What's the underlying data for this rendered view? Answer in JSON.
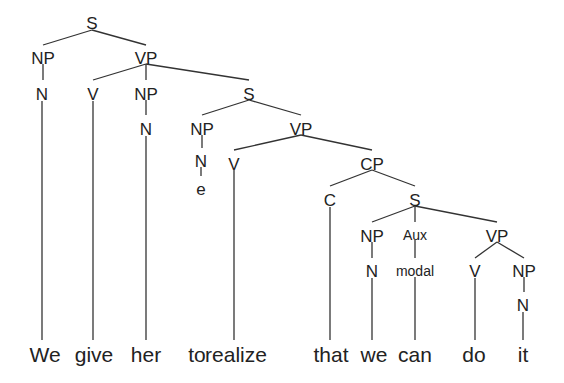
{
  "diagram": {
    "type": "syntax-tree",
    "nodes": [
      {
        "id": "s0",
        "label": "S",
        "x": 92,
        "y": 25,
        "cls": "node"
      },
      {
        "id": "np1",
        "label": "NP",
        "x": 43,
        "y": 60,
        "cls": "node"
      },
      {
        "id": "vp1",
        "label": "VP",
        "x": 146,
        "y": 60,
        "cls": "node"
      },
      {
        "id": "n1",
        "label": "N",
        "x": 42,
        "y": 96,
        "cls": "node"
      },
      {
        "id": "v1",
        "label": "V",
        "x": 93,
        "y": 96,
        "cls": "node"
      },
      {
        "id": "np2",
        "label": "NP",
        "x": 146,
        "y": 96,
        "cls": "node"
      },
      {
        "id": "s1",
        "label": "S",
        "x": 249,
        "y": 96,
        "cls": "node"
      },
      {
        "id": "n2",
        "label": "N",
        "x": 146,
        "y": 131,
        "cls": "node"
      },
      {
        "id": "np3",
        "label": "NP",
        "x": 202,
        "y": 131,
        "cls": "node"
      },
      {
        "id": "vp2",
        "label": "VP",
        "x": 301,
        "y": 131,
        "cls": "node"
      },
      {
        "id": "n3",
        "label": "N",
        "x": 201,
        "y": 163,
        "cls": "node"
      },
      {
        "id": "v2",
        "label": "V",
        "x": 234,
        "y": 166,
        "cls": "node"
      },
      {
        "id": "cp1",
        "label": "CP",
        "x": 372,
        "y": 166,
        "cls": "node"
      },
      {
        "id": "e1",
        "label": "e",
        "x": 201,
        "y": 191,
        "cls": "node"
      },
      {
        "id": "c1",
        "label": "C",
        "x": 330,
        "y": 202,
        "cls": "node"
      },
      {
        "id": "s2",
        "label": "S",
        "x": 415,
        "y": 202,
        "cls": "node"
      },
      {
        "id": "np4",
        "label": "NP",
        "x": 372,
        "y": 238,
        "cls": "node"
      },
      {
        "id": "aux1",
        "label": "Aux",
        "x": 415,
        "y": 236,
        "cls": "small"
      },
      {
        "id": "vp3",
        "label": "VP",
        "x": 497,
        "y": 238,
        "cls": "node"
      },
      {
        "id": "n4",
        "label": "N",
        "x": 372,
        "y": 273,
        "cls": "node"
      },
      {
        "id": "modal1",
        "label": "modal",
        "x": 415,
        "y": 272,
        "cls": "small"
      },
      {
        "id": "v3",
        "label": "V",
        "x": 475,
        "y": 273,
        "cls": "node"
      },
      {
        "id": "np5",
        "label": "NP",
        "x": 524,
        "y": 273,
        "cls": "node"
      },
      {
        "id": "n5",
        "label": "N",
        "x": 523,
        "y": 307,
        "cls": "node"
      }
    ],
    "edges": [
      [
        92,
        30,
        43,
        45
      ],
      [
        92,
        30,
        146,
        45
      ],
      [
        43,
        64,
        43,
        80
      ],
      [
        146,
        64,
        93,
        80
      ],
      [
        146,
        64,
        146,
        80
      ],
      [
        146,
        64,
        249,
        80
      ],
      [
        146,
        100,
        146,
        115
      ],
      [
        249,
        100,
        202,
        115
      ],
      [
        249,
        100,
        301,
        115
      ],
      [
        202,
        135,
        202,
        148
      ],
      [
        301,
        135,
        234,
        150
      ],
      [
        301,
        135,
        372,
        150
      ],
      [
        201,
        167,
        201,
        176
      ],
      [
        372,
        170,
        330,
        186
      ],
      [
        372,
        170,
        415,
        186
      ],
      [
        415,
        206,
        372,
        222
      ],
      [
        415,
        206,
        415,
        222
      ],
      [
        415,
        206,
        497,
        222
      ],
      [
        372,
        242,
        372,
        258
      ],
      [
        415,
        240,
        415,
        258
      ],
      [
        497,
        242,
        475,
        258
      ],
      [
        497,
        242,
        524,
        258
      ],
      [
        524,
        277,
        524,
        292
      ],
      [
        42,
        101,
        42,
        340
      ],
      [
        93,
        101,
        93,
        340
      ],
      [
        146,
        136,
        146,
        340
      ],
      [
        234,
        170,
        234,
        340
      ],
      [
        330,
        207,
        330,
        340
      ],
      [
        372,
        278,
        372,
        340
      ],
      [
        415,
        277,
        415,
        340
      ],
      [
        475,
        278,
        475,
        340
      ],
      [
        523,
        312,
        523,
        340
      ]
    ],
    "words": [
      {
        "text": "We",
        "x": 45
      },
      {
        "text": "give",
        "x": 94
      },
      {
        "text": "her",
        "x": 146
      },
      {
        "text": "to",
        "x": 197
      },
      {
        "text": "realize",
        "x": 236
      },
      {
        "text": "that",
        "x": 331
      },
      {
        "text": "we",
        "x": 374
      },
      {
        "text": "can",
        "x": 415
      },
      {
        "text": "do",
        "x": 474
      },
      {
        "text": "it",
        "x": 523
      }
    ],
    "word_baseline_y": 362
  }
}
